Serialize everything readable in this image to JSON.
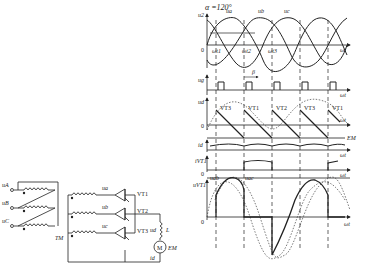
{
  "waveforms": {
    "alpha_label": "α =120°",
    "panel1": {
      "ylabel": "u2",
      "phases": [
        "ua",
        "ub",
        "uc"
      ],
      "points": [
        "ωt1",
        "ωt2",
        "ωt3"
      ],
      "origin": "0",
      "xlabel": "ωt"
    },
    "panel2": {
      "ylabel": "ug",
      "beta": "β",
      "xlabel": "ωt"
    },
    "panel3": {
      "ylabel": "ud",
      "origin": "0",
      "thyristors": [
        "VT3",
        "VT1",
        "VT2",
        "VT3",
        "VT1"
      ],
      "em": "EM",
      "xlabel": "ωt"
    },
    "panel4": {
      "ylabel": "id",
      "xlabel": "ωt"
    },
    "panel5": {
      "ylabel": "iVT1",
      "origin": "0",
      "xlabel": "ωt"
    },
    "panel6": {
      "ylabel": "uVT1",
      "origin": "0",
      "labels": [
        "uab",
        "uac"
      ],
      "xlabel": "ωt"
    }
  },
  "circuit": {
    "primary": [
      "uA",
      "uB",
      "uC"
    ],
    "transformer": "TM",
    "secondary": [
      "ua",
      "ub",
      "uc"
    ],
    "thyristors": [
      "VT1",
      "VT2",
      "VT3"
    ],
    "ud": "ud",
    "inductor": "L",
    "motor": "M",
    "emf": "EM",
    "current": "id"
  }
}
